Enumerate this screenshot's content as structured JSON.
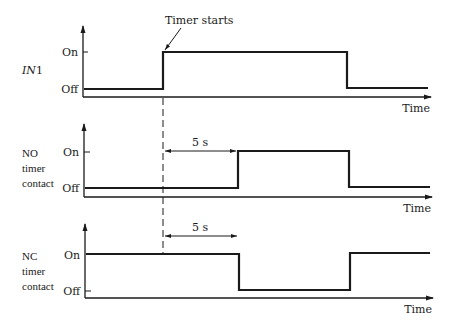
{
  "annotation": {
    "timer_starts": "Timer starts",
    "delay_label": "5 s"
  },
  "panels": [
    {
      "id": "in1",
      "signal_label_italic": "IN",
      "signal_label_rest": "1",
      "y_ticks": {
        "on": "On",
        "off": "Off"
      },
      "x_label": "Time",
      "waveform": "Off -> On at timer start, On -> Off later"
    },
    {
      "id": "no",
      "signal_label_lines": [
        "NO",
        "timer",
        "contact"
      ],
      "y_ticks": {
        "on": "On",
        "off": "Off"
      },
      "x_label": "Time",
      "waveform": "Off, goes On 5 s after timer start, returns Off when IN1 goes Off"
    },
    {
      "id": "nc",
      "signal_label_lines": [
        "NC",
        "timer",
        "contact"
      ],
      "y_ticks": {
        "on": "On",
        "off": "Off"
      },
      "x_label": "Time",
      "waveform": "On, goes Off 5 s after timer start, returns On when IN1 goes Off"
    }
  ],
  "colors": {
    "line": "#1a1a1a",
    "background": "#ffffff"
  }
}
